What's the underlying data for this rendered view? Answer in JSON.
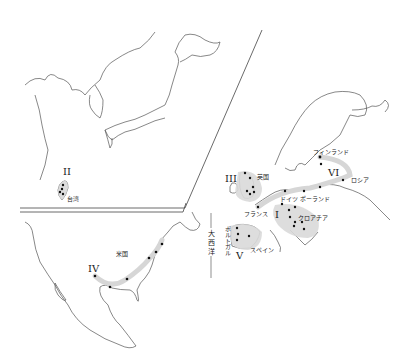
{
  "labels": {
    "taiwan": "台湾",
    "usa": "米国",
    "uk": "英国",
    "france": "フランス",
    "germany": "ドイツ",
    "poland": "ポーランド",
    "finland": "フィンランド",
    "russia": "ロシア",
    "croatia": "クロアチア",
    "spain": "スペイン",
    "portugal": "ポルトガル",
    "atlantic": "大西洋"
  },
  "regions": {
    "I": "I",
    "II": "II",
    "III": "III",
    "IV": "IV",
    "V": "V",
    "VI": "VI"
  },
  "colors": {
    "coastline": "#555555",
    "highlight": "#d9d9d9",
    "dot": "#111111"
  }
}
